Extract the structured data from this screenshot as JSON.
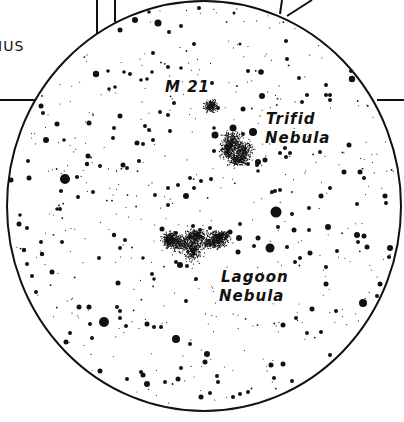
{
  "chart": {
    "constellation_label_fragment": "IUS",
    "labels": {
      "m21": "M 21",
      "trifid_line1": "Trifid",
      "trifid_line2": "Nebula",
      "lagoon_line1": "Lagoon",
      "lagoon_line2": "Nebula"
    },
    "colors": {
      "ink": "#111111",
      "background": "#ffffff"
    },
    "field_circle": {
      "cx": 204,
      "cy": 206,
      "rx": 197,
      "ry": 205
    },
    "objects": [
      {
        "name": "M 21",
        "type": "open-cluster",
        "x": 211,
        "y": 106
      },
      {
        "name": "Trifid Nebula",
        "type": "nebula",
        "x": 237,
        "y": 146
      },
      {
        "name": "Lagoon Nebula",
        "type": "nebula",
        "x": 196,
        "y": 243
      }
    ]
  }
}
